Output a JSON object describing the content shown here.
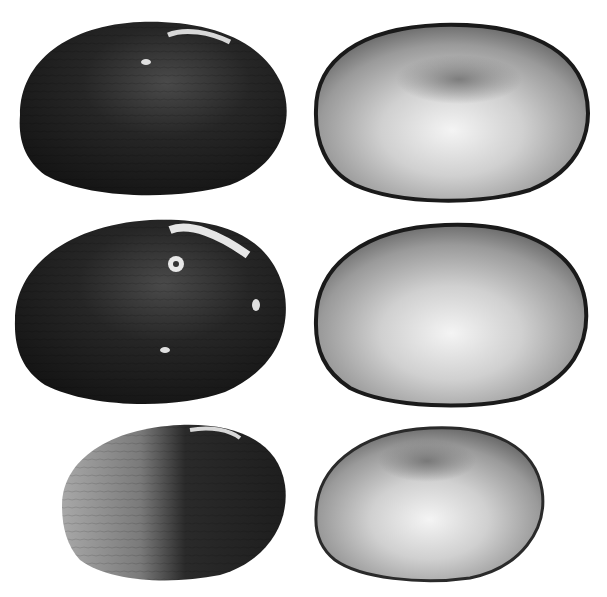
{
  "image": {
    "subject": "Freshwater mussel shell valves",
    "background": "#ffffff",
    "layout": "3 rows x 2 columns",
    "shells": [
      {
        "row": 1,
        "col": 1,
        "view": "exterior",
        "tone": "dark"
      },
      {
        "row": 1,
        "col": 2,
        "view": "interior",
        "tone": "nacreous"
      },
      {
        "row": 2,
        "col": 1,
        "view": "exterior",
        "tone": "dark"
      },
      {
        "row": 2,
        "col": 2,
        "view": "interior",
        "tone": "nacreous"
      },
      {
        "row": 3,
        "col": 1,
        "view": "exterior",
        "tone": "dark-weathered"
      },
      {
        "row": 3,
        "col": 2,
        "view": "interior",
        "tone": "nacreous"
      }
    ],
    "colors": {
      "exterior_dark": "#1c1c1c",
      "exterior_mid": "#3a3a3a",
      "exterior_weathered": "#9a9a9a",
      "interior_light": "#f2f2f2",
      "interior_mid": "#8a8a8a",
      "interior_rim": "#1a1a1a"
    }
  }
}
